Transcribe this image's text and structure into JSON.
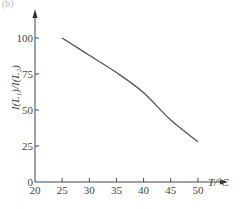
{
  "panel_label": "(b)",
  "chart_data": {
    "type": "line",
    "title": "",
    "xlabel": "T/°C",
    "ylabel": "I(L₁)/I(L₂)",
    "xlim": [
      20,
      52
    ],
    "ylim": [
      0,
      110
    ],
    "x_ticks": [
      20,
      25,
      30,
      35,
      40,
      45,
      50
    ],
    "y_ticks": [
      0,
      25,
      50,
      75,
      100
    ],
    "grid": false,
    "legend": null,
    "series": [
      {
        "name": "I(L1)/I(L2)",
        "x": [
          25,
          30,
          35,
          40,
          45,
          50
        ],
        "values": [
          100,
          88,
          76,
          62,
          43,
          28
        ]
      }
    ],
    "line_color": "#555555"
  }
}
